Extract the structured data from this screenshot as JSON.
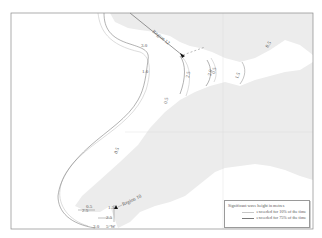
{
  "map": {
    "title": "Significant wave height contours",
    "colors": {
      "sea": "#ffffff",
      "land": "#ececec",
      "frame": "#8a8a8a",
      "contour_10": "#c4c4c4",
      "contour_75": "#7d7d7d",
      "marker": "#111111"
    },
    "regions": [
      {
        "name": "region-12",
        "label": "Region 12"
      },
      {
        "name": "region-10",
        "label": "Region 10"
      }
    ],
    "contour_labels": [
      {
        "name": "contour-label-3-0-north",
        "text": "3.0"
      },
      {
        "name": "contour-label-1-0-north",
        "text": "1.0"
      },
      {
        "name": "contour-label-2-5-north",
        "text": "2.5"
      },
      {
        "name": "contour-label-2-0-north",
        "text": "2.0"
      },
      {
        "name": "contour-label-0-5-north",
        "text": "0.5"
      },
      {
        "name": "contour-label-1-5-east",
        "text": "1.5"
      },
      {
        "name": "contour-label-0-5-northeast",
        "text": "0.5"
      },
      {
        "name": "contour-label-0-5-center",
        "text": "0.5"
      },
      {
        "name": "contour-label-0-5-west",
        "text": "0.5"
      },
      {
        "name": "contour-label-0-5-southwest",
        "text": "0.5"
      },
      {
        "name": "contour-label-1-5-southwest",
        "text": "1.5"
      },
      {
        "name": "contour-label-2-5-southwest-a",
        "text": "2.5"
      },
      {
        "name": "contour-label-2-5-southwest-b",
        "text": "2.5"
      },
      {
        "name": "contour-label-3-0-south",
        "text": "3.0"
      },
      {
        "name": "longitude-label",
        "text": "5°W"
      }
    ]
  },
  "legend": {
    "title": "Significant wave height in metres",
    "items": [
      {
        "label": "exceeded for 10% of the time"
      },
      {
        "label": "exceeded for 75% of the time"
      }
    ]
  }
}
